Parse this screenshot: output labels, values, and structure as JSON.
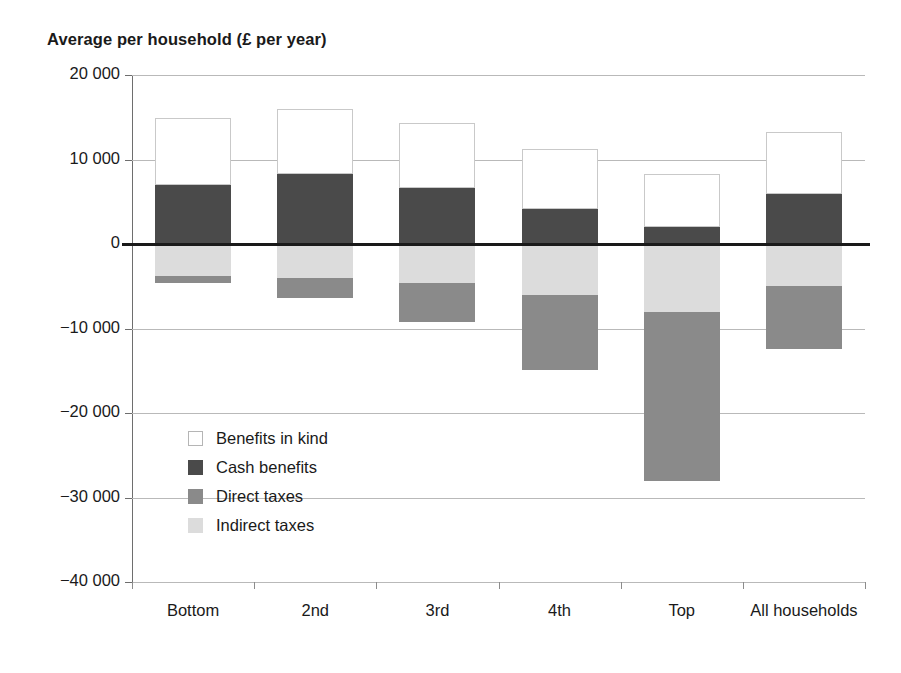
{
  "chart_data": {
    "type": "bar",
    "subtype": "stacked-diverging",
    "title": "Average per household (£ per year)",
    "xlabel": "",
    "ylabel": "",
    "ylim": [
      -40000,
      20000
    ],
    "ytick_step": 10000,
    "grid": true,
    "legend_position": "inside-lower-left",
    "categories": [
      "Bottom",
      "2nd",
      "3rd",
      "4th",
      "Top",
      "All households"
    ],
    "ytick_labels": [
      "20 000",
      "10 000",
      "0",
      "-10 000",
      "-20 000",
      "-30 000",
      "-40 000"
    ],
    "ytick_values": [
      20000,
      10000,
      0,
      -10000,
      -20000,
      -30000,
      -40000
    ],
    "series": [
      {
        "name": "Benefits in kind",
        "color": "#ffffff",
        "values": [
          7900,
          7700,
          7700,
          7000,
          6300,
          7300
        ]
      },
      {
        "name": "Cash benefits",
        "color": "#4a4a4a",
        "values": [
          7000,
          8300,
          6600,
          4200,
          2000,
          5900
        ]
      },
      {
        "name": "Direct taxes",
        "color": "#8a8a8a",
        "values": [
          -800,
          -2400,
          -4600,
          -8900,
          -20000,
          -7400
        ]
      },
      {
        "name": "Indirect taxes",
        "color": "#dcdcdc",
        "values": [
          -3800,
          -4000,
          -4600,
          -6000,
          -8000,
          -5000
        ]
      }
    ]
  },
  "legend": {
    "items": [
      {
        "label": "Benefits in kind",
        "swatch": "kind"
      },
      {
        "label": "Cash benefits",
        "swatch": "cash"
      },
      {
        "label": "Direct taxes",
        "swatch": "direct"
      },
      {
        "label": "Indirect taxes",
        "swatch": "indirect"
      }
    ]
  }
}
